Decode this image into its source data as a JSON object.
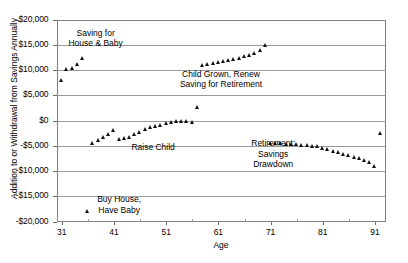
{
  "chart_data": {
    "type": "scatter",
    "title": "",
    "xlabel": "Age",
    "ylabel": "Addition to or Withdrawal from Savings Annually",
    "xlim": [
      30,
      93
    ],
    "ylim": [
      -20000,
      20000
    ],
    "grid": true,
    "legend": "none",
    "xticks": [
      "31",
      "41",
      "51",
      "61",
      "71",
      "81",
      "91"
    ],
    "xtick_values": [
      31,
      41,
      51,
      61,
      71,
      81,
      91
    ],
    "yticks": [
      "$20,000",
      "$15,000",
      "$10,000",
      "$5,000",
      "$0",
      "-$5,000",
      "-$10,000",
      "-$15,000",
      "-$20,000"
    ],
    "ytick_values": [
      20000,
      15000,
      10000,
      5000,
      0,
      -5000,
      -10000,
      -15000,
      -20000
    ],
    "series": [
      {
        "name": "Annual savings flow",
        "marker": "triangle",
        "color": "#111111",
        "x": [
          31,
          32,
          33,
          34,
          35,
          36,
          37,
          38,
          39,
          40,
          41,
          42,
          43,
          44,
          45,
          46,
          47,
          48,
          49,
          50,
          51,
          52,
          53,
          54,
          55,
          56,
          57,
          58,
          59,
          60,
          61,
          62,
          63,
          64,
          65,
          66,
          67,
          68,
          69,
          70,
          71,
          72,
          73,
          74,
          75,
          76,
          77,
          78,
          79,
          80,
          81,
          82,
          83,
          84,
          85,
          86,
          87,
          88,
          89,
          90,
          91,
          92
        ],
        "y": [
          8000,
          10200,
          10300,
          11200,
          12300,
          -18000,
          -4500,
          -3900,
          -3200,
          -2700,
          -1900,
          -3600,
          -3500,
          -3300,
          -2600,
          -2200,
          -1700,
          -1300,
          -1100,
          -900,
          -600,
          -400,
          -200,
          -100,
          -50,
          -300,
          2700,
          11000,
          11100,
          11300,
          11500,
          11700,
          11900,
          12100,
          12400,
          12700,
          13000,
          13400,
          13900,
          15000,
          -4500,
          -4500,
          -4550,
          -4600,
          -4650,
          -4700,
          -4800,
          -4900,
          -5000,
          -5150,
          -5400,
          -5700,
          -6000,
          -6300,
          -6600,
          -6900,
          -7200,
          -7500,
          -7900,
          -8300,
          -9000,
          -2500
        ]
      }
    ],
    "annotations": [
      {
        "id": "saving-house-baby",
        "text": "Saving for\nHouse & Baby",
        "x": 37.5,
        "y": 16300
      },
      {
        "id": "child-grown-renew",
        "text": "Child Grown, Renew\nSaving for Retirement",
        "x": 61.5,
        "y": 8200
      },
      {
        "id": "raise-child",
        "text": "Raise Child",
        "x": 48.5,
        "y": -5200
      },
      {
        "id": "retirement-drawdown",
        "text": "Retirement:\nSavings\nDrawdown",
        "x": 71.5,
        "y": -6600
      },
      {
        "id": "buy-house-have-baby",
        "text": "Buy House,\nHave Baby",
        "x": 42.0,
        "y": -16700
      }
    ]
  },
  "style": {
    "grid_color": "#9a9a9a",
    "frame_color": "#808080",
    "marker_color": "#111111",
    "background": "#ffffff"
  }
}
